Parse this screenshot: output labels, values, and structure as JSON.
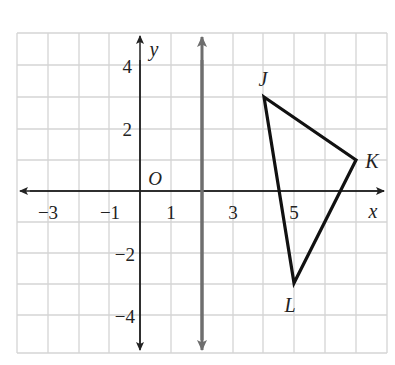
{
  "figure": {
    "axes": {
      "x_label": "x",
      "y_label": "y",
      "origin_label": "O",
      "x_ticks": [
        {
          "value": -3,
          "label": "−3"
        },
        {
          "value": -1,
          "label": "−1"
        },
        {
          "value": 1,
          "label": "1"
        },
        {
          "value": 3,
          "label": "3"
        },
        {
          "value": 5,
          "label": "5"
        }
      ],
      "y_ticks": [
        {
          "value": 4,
          "label": "4"
        },
        {
          "value": 2,
          "label": "2"
        },
        {
          "value": -2,
          "label": "−2"
        },
        {
          "value": -4,
          "label": "−4"
        }
      ]
    },
    "reflection_line": {
      "equation": "x = 2",
      "color": "#6e6e6e"
    },
    "triangle": {
      "vertices": [
        {
          "name": "J",
          "x": 4,
          "y": 3
        },
        {
          "name": "K",
          "x": 7,
          "y": 1
        },
        {
          "name": "L",
          "x": 5,
          "y": -3
        }
      ],
      "color": "#111111"
    },
    "grid_color": "#d4d4d4"
  }
}
